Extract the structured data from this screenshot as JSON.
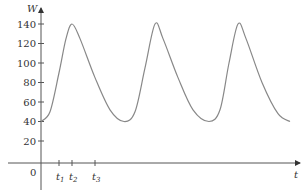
{
  "chart_data": {
    "type": "line",
    "title": "",
    "xlabel": "t",
    "ylabel": "W",
    "ylim": [
      0,
      150
    ],
    "yticks": [
      20,
      40,
      60,
      80,
      100,
      120,
      140
    ],
    "ytick_labels": [
      "20",
      "40",
      "60",
      "80",
      "100",
      "120",
      "140"
    ],
    "origin_label": "0",
    "xticks": [
      {
        "label": "t",
        "sub": "1"
      },
      {
        "label": "t",
        "sub": "2"
      },
      {
        "label": "t",
        "sub": "3"
      }
    ],
    "grid": false,
    "legend": null,
    "series": [
      {
        "name": "W(t)",
        "description": "Periodic curve oscillating between about 40 and 140 with three peaks",
        "x_px": [
          41,
          50,
          59,
          66,
          72,
          80,
          95,
          110,
          124,
          135,
          145,
          155,
          163,
          178,
          193,
          209,
          220,
          229,
          238,
          246,
          262,
          278,
          290
        ],
        "values": [
          40,
          50,
          90,
          125,
          140,
          125,
          85,
          52,
          40,
          50,
          95,
          140,
          125,
          85,
          52,
          40,
          52,
          100,
          140,
          125,
          80,
          48,
          40
        ]
      }
    ],
    "peaks": [
      140,
      140,
      140
    ],
    "troughs": [
      40,
      40,
      40
    ],
    "color": "#888888"
  }
}
